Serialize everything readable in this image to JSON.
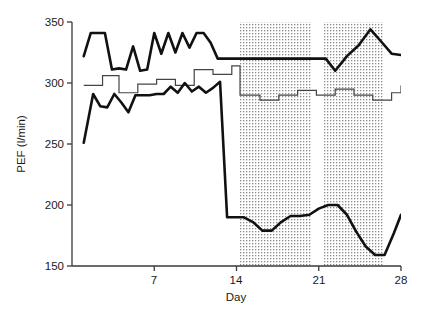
{
  "chart_data": {
    "type": "line",
    "title": "",
    "xlabel": "Day",
    "ylabel": "PEF (l/min)",
    "xlim": [
      0,
      28
    ],
    "ylim": [
      150,
      350
    ],
    "xticks": [
      7,
      14,
      21,
      28
    ],
    "xtick_labels": [
      "7",
      "14",
      "21",
      "28"
    ],
    "yticks": [
      150,
      200,
      250,
      300,
      350
    ],
    "ytick_labels": [
      "150",
      "200",
      "250",
      "300",
      "350"
    ],
    "grid": false,
    "legend": "none",
    "shaded_bands": [
      {
        "name": "treatment-band-1",
        "x_start": 14.3,
        "x_end": 20.4,
        "style": "dotted"
      },
      {
        "name": "treatment-band-2",
        "x_start": 21.4,
        "x_end": 26.5,
        "style": "dotted"
      }
    ],
    "series": [
      {
        "name": "upper-peak-line",
        "style": "thick",
        "x": [
          1.0,
          1.6,
          2.2,
          2.8,
          3.4,
          4.0,
          4.6,
          5.2,
          5.8,
          6.4,
          7.0,
          7.6,
          8.2,
          8.8,
          9.4,
          10.0,
          10.6,
          11.2,
          11.8,
          12.4,
          13.0,
          13.6,
          14.2,
          14.8,
          20.6,
          21.6,
          22.4,
          23.4,
          24.4,
          25.4,
          26.4,
          27.2,
          28.0
        ],
        "y": [
          322,
          341,
          341,
          341,
          311,
          312,
          311,
          330,
          310,
          311,
          341,
          324,
          341,
          325,
          341,
          329,
          341,
          341,
          333,
          320,
          320,
          320,
          320,
          320,
          320,
          320,
          310,
          322,
          331,
          344,
          333,
          324,
          323
        ]
      },
      {
        "name": "middle-step-line",
        "style": "thin-step",
        "x": [
          1.0,
          2.0,
          2.6,
          3.2,
          4.0,
          4.8,
          5.6,
          6.4,
          7.2,
          8.0,
          8.8,
          9.6,
          10.4,
          11.2,
          12.0,
          12.8,
          13.6,
          14.3,
          15.2,
          16.0,
          16.8,
          17.6,
          18.4,
          19.2,
          20.0,
          20.8,
          21.6,
          22.4,
          23.2,
          24.0,
          24.8,
          25.6,
          26.4,
          27.2,
          28.0
        ],
        "y": [
          298,
          298,
          306,
          306,
          292,
          292,
          299,
          299,
          303,
          303,
          298,
          298,
          311,
          311,
          307,
          307,
          314,
          290,
          290,
          286,
          286,
          290,
          290,
          294,
          294,
          290,
          290,
          295,
          295,
          290,
          290,
          286,
          286,
          292,
          298
        ]
      },
      {
        "name": "lower-trough-line",
        "style": "thick",
        "x": [
          1.0,
          1.8,
          2.4,
          3.0,
          3.6,
          4.2,
          4.8,
          5.4,
          6.0,
          6.6,
          7.2,
          7.8,
          8.4,
          9.0,
          9.6,
          10.2,
          10.8,
          11.4,
          12.0,
          12.6,
          13.2,
          13.8,
          14.2,
          14.6,
          15.4,
          16.2,
          17.0,
          17.8,
          18.6,
          19.4,
          20.2,
          21.0,
          21.8,
          22.6,
          23.4,
          24.2,
          25.0,
          25.8,
          26.6,
          27.4,
          28.0
        ],
        "y": [
          251,
          291,
          281,
          280,
          291,
          284,
          276,
          290,
          290,
          290,
          291,
          291,
          297,
          292,
          300,
          293,
          297,
          292,
          296,
          301,
          190,
          190,
          190,
          190,
          186,
          179,
          179,
          186,
          191,
          191,
          192,
          197,
          200,
          200,
          192,
          178,
          166,
          159,
          159,
          177,
          192
        ]
      }
    ]
  },
  "axis": {
    "y_title": "PEF (l/min)",
    "x_title": "Day",
    "y_tick_350": "350",
    "y_tick_300": "300",
    "y_tick_250": "250",
    "y_tick_200": "200",
    "y_tick_150": "150",
    "x_tick_7": "7",
    "x_tick_14": "14",
    "x_tick_21": "21",
    "x_tick_28": "28"
  },
  "colors": {
    "line": "#111111",
    "axis": "#3a3a3a",
    "shade_dot": "#777777",
    "background": "#ffffff"
  }
}
